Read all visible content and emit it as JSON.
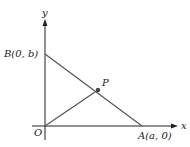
{
  "diagram": {
    "type": "coordinate-geometry",
    "axes": {
      "x_label": "x",
      "y_label": "y",
      "origin_label": "O"
    },
    "points": [
      {
        "id": "B",
        "label": "B(0, b)",
        "coords": "(0, b)"
      },
      {
        "id": "A",
        "label": "A(a, 0)",
        "coords": "(a, 0)"
      },
      {
        "id": "P",
        "label": "P",
        "note": "midpoint of AB"
      },
      {
        "id": "O",
        "label": "O",
        "coords": "(0, 0)"
      }
    ],
    "segments": [
      "BA",
      "OP"
    ],
    "colors": {
      "axis": "#222222",
      "segment": "#555555",
      "point": "#444444"
    }
  }
}
